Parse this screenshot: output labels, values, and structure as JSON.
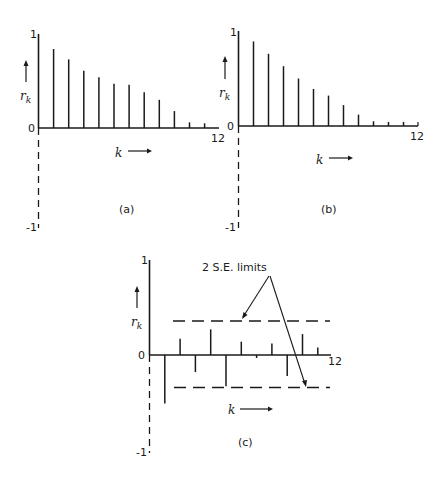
{
  "chart_data": [
    {
      "type": "bar",
      "panel": "(a)",
      "title": "",
      "xlabel": "k",
      "ylabel": "r_k",
      "x": [
        1,
        2,
        3,
        4,
        5,
        6,
        7,
        8,
        9,
        10,
        11
      ],
      "values": [
        0.84,
        0.73,
        0.61,
        0.54,
        0.47,
        0.46,
        0.38,
        0.3,
        0.18,
        0.06,
        0.05
      ],
      "ylim": [
        -1,
        1
      ],
      "xlim": [
        0,
        12
      ],
      "y_tick_labels": [
        "1",
        "0",
        "-1"
      ],
      "x_tick_labels": [
        "12"
      ],
      "grid": false
    },
    {
      "type": "bar",
      "panel": "(b)",
      "title": "",
      "xlabel": "k",
      "ylabel": "r_k",
      "x": [
        1,
        2,
        3,
        4,
        5,
        6,
        7,
        8,
        9,
        10,
        11
      ],
      "values": [
        0.89,
        0.76,
        0.63,
        0.5,
        0.39,
        0.32,
        0.22,
        0.12,
        0.05,
        0.01,
        0.01
      ],
      "ylim": [
        -1,
        1
      ],
      "xlim": [
        0,
        12
      ],
      "y_tick_labels": [
        "1",
        "0",
        "-1"
      ],
      "x_tick_labels": [
        "12"
      ],
      "grid": false
    },
    {
      "type": "bar",
      "panel": "(c)",
      "title": "",
      "xlabel": "k",
      "ylabel": "r_k",
      "x": [
        1,
        2,
        3,
        4,
        5,
        6,
        7,
        8,
        9,
        10,
        11
      ],
      "values": [
        -0.51,
        0.17,
        -0.18,
        0.27,
        -0.33,
        0.14,
        -0.02,
        0.12,
        -0.22,
        0.22,
        0.08
      ],
      "limits": {
        "upper": 0.35,
        "lower": -0.35
      },
      "annotation": "2 S.E. limits",
      "ylim": [
        -1,
        1
      ],
      "xlim": [
        0,
        12
      ],
      "y_tick_labels": [
        "1",
        "0",
        "-1"
      ],
      "x_tick_labels": [
        "12"
      ],
      "grid": false
    }
  ],
  "labels": {
    "one": "1",
    "zero": "0",
    "minus_one": "-1",
    "twelve": "12",
    "k": "k",
    "r": "r",
    "r_sub": "k",
    "panel_a": "(a)",
    "panel_b": "(b)",
    "panel_c": "(c)",
    "se_limits": "2 S.E. limits"
  },
  "colors": {
    "ink": "#1a1a1a",
    "background": "#ffffff"
  }
}
